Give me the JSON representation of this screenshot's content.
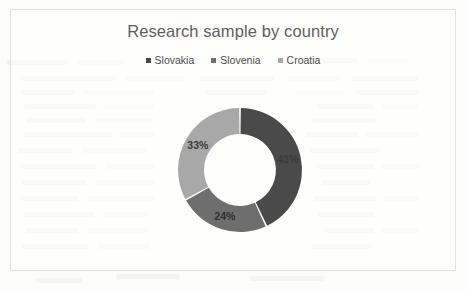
{
  "chart_data": {
    "type": "pie",
    "variant": "doughnut",
    "title": "Research sample by country",
    "categories": [
      "Slovakia",
      "Slovenia",
      "Croatia"
    ],
    "values": [
      43,
      24,
      33
    ],
    "value_labels": [
      "43%",
      "24%",
      "33%"
    ],
    "colors": [
      "#4a4a4a",
      "#6e6e6e",
      "#a8a8a8"
    ],
    "legend_position": "top",
    "legend_entries": [
      "Slovakia",
      "Slovenia",
      "Croatia"
    ],
    "start_angle_deg": 0,
    "direction": "clockwise",
    "hole_ratio": 0.58,
    "units": "percent",
    "xlabel": "",
    "ylabel": "",
    "grid": false,
    "data_labels_shown": [
      "43%",
      "24%",
      "33%"
    ]
  },
  "chart": {
    "title": "Research sample by country",
    "legend": [
      {
        "label": "Slovakia",
        "color": "#4a4a4a"
      },
      {
        "label": "Slovenia",
        "color": "#6e6e6e"
      },
      {
        "label": "Croatia",
        "color": "#a8a8a8"
      }
    ],
    "slices": [
      {
        "name": "Slovakia",
        "percent": 43,
        "label": "43%",
        "color": "#4a4a4a",
        "label_color": "#3a3a3a"
      },
      {
        "name": "Slovenia",
        "percent": 24,
        "label": "24%",
        "color": "#6e6e6e",
        "label_color": "#2f2f2f"
      },
      {
        "name": "Croatia",
        "percent": 33,
        "label": "33%",
        "color": "#a8a8a8",
        "label_color": "#3a3a3a"
      }
    ]
  }
}
